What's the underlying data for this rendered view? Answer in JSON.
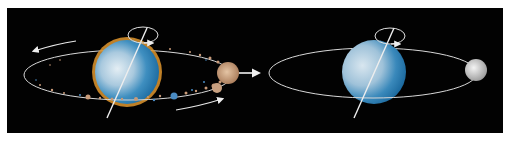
{
  "figure": {
    "panels": [
      {
        "id": "debris-disk",
        "description": "Planet surrounded by orbiting debris ring after impact",
        "planet": {
          "cx": 127,
          "cy": 72,
          "r": 33,
          "rim_color": "#e0962e",
          "fill_light": "#d6e6f0",
          "fill_dark": "#2a7fb4"
        },
        "orbit": {
          "cx": 128,
          "cy": 75,
          "rx": 104,
          "ry": 25
        },
        "debris_color": "#c89a78",
        "accretion_clump": {
          "cx": 228,
          "cy": 73,
          "r": 11
        },
        "arrows": [
          "orbit-arrow-top-left",
          "orbit-arrow-bottom-right",
          "spin-arrow"
        ]
      },
      {
        "id": "moon-formed",
        "description": "Planet with single moon in orbit",
        "planet": {
          "cx": 374,
          "cy": 72,
          "r": 32,
          "fill_light": "#cfe0ec",
          "fill_dark": "#2676ad"
        },
        "orbit": {
          "cx": 373,
          "cy": 73,
          "rx": 104,
          "ry": 25
        },
        "moon": {
          "cx": 476,
          "cy": 70,
          "r": 11,
          "color": "#d8d8d8"
        },
        "arrows": [
          "spin-arrow"
        ]
      }
    ],
    "transition_arrow": "right-arrow",
    "colors": {
      "background": "#020202",
      "line": "#e8e8e8",
      "page": "#ffffff"
    }
  }
}
